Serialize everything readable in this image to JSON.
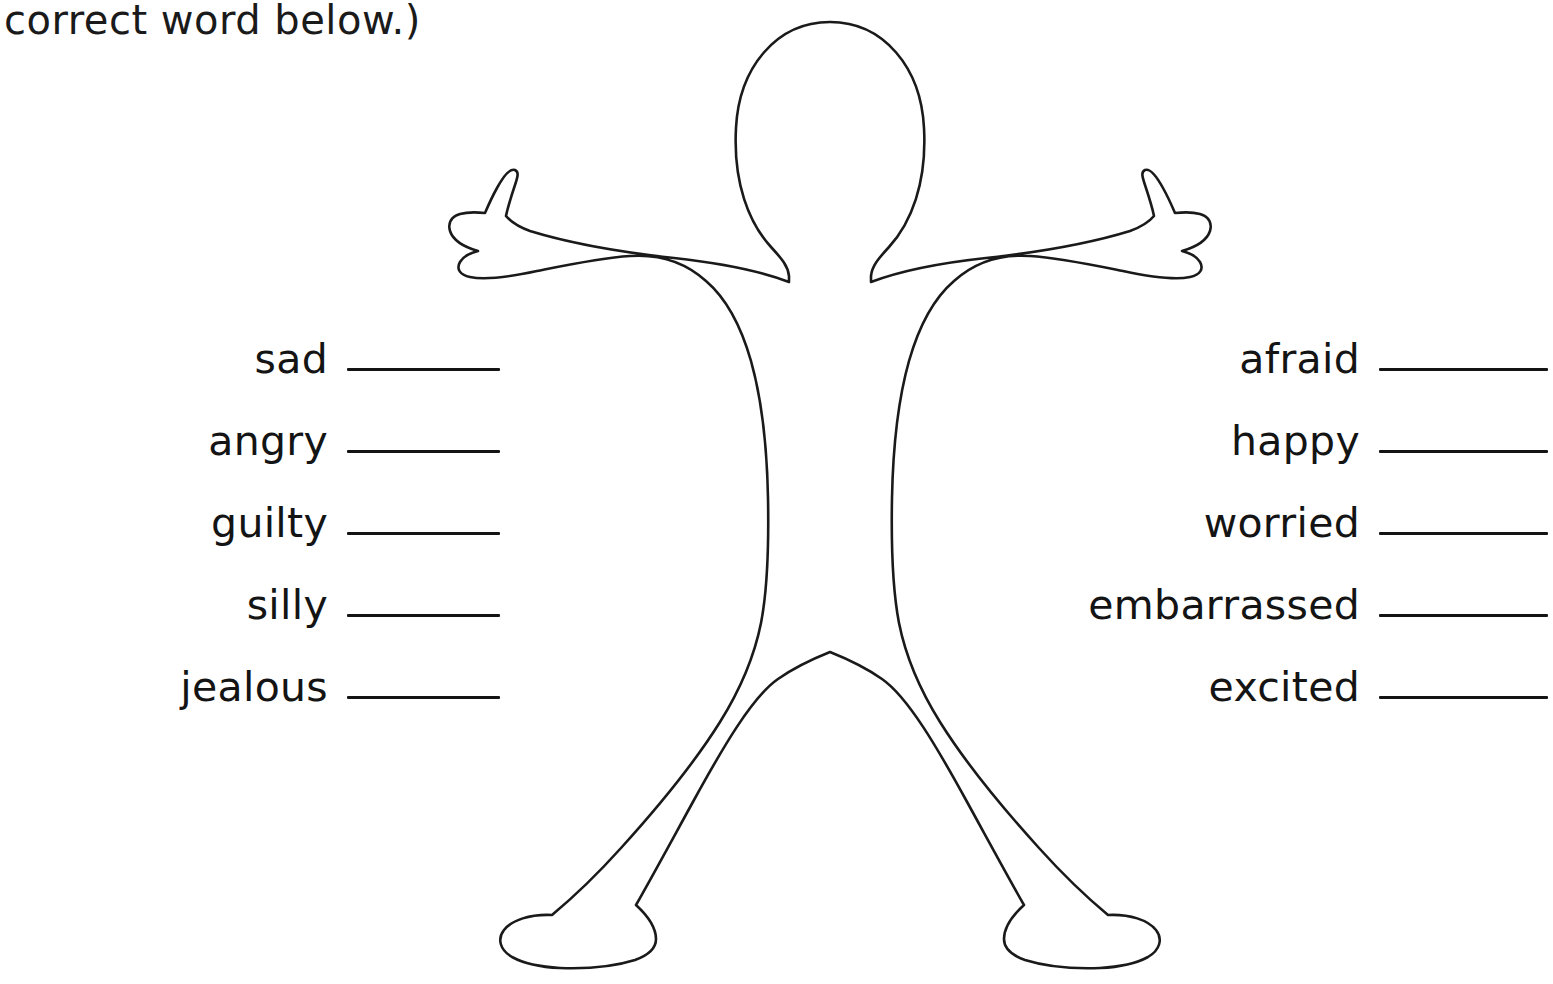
{
  "worksheet": {
    "instruction_text": "correct word below.)",
    "figure": {
      "name": "body-outline",
      "description": "blank gingerbread-style human body outline with arms outstretched and legs apart",
      "stroke_color": "#1a1a1a",
      "fill_color": "#ffffff"
    },
    "columns": {
      "left": {
        "name": "feelings-word-list-left",
        "items": [
          {
            "word": "sad"
          },
          {
            "word": "angry"
          },
          {
            "word": "guilty"
          },
          {
            "word": "silly"
          },
          {
            "word": "jealous"
          }
        ]
      },
      "right": {
        "name": "feelings-word-list-right",
        "items": [
          {
            "word": "afraid"
          },
          {
            "word": "happy"
          },
          {
            "word": "worried"
          },
          {
            "word": "embarrassed"
          },
          {
            "word": "excited"
          }
        ]
      }
    }
  }
}
